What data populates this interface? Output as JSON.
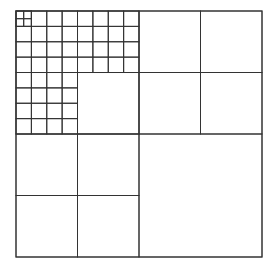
{
  "diagram": {
    "type": "quadtree-subdivision",
    "background": "#ffffff",
    "line_color": "#333333",
    "origin": [
      16,
      11
    ],
    "size": 246,
    "cells": [
      {
        "x": 0,
        "y": 0,
        "s": 1
      },
      {
        "x": 0,
        "y": 0,
        "s": 0.5
      },
      {
        "x": 0.5,
        "y": 0,
        "s": 0.25
      },
      {
        "x": 0.75,
        "y": 0,
        "s": 0.25
      },
      {
        "x": 0.5,
        "y": 0.25,
        "s": 0.25
      },
      {
        "x": 0.75,
        "y": 0.25,
        "s": 0.25
      },
      {
        "x": 0,
        "y": 0.5,
        "s": 0.25
      },
      {
        "x": 0.25,
        "y": 0.5,
        "s": 0.25
      },
      {
        "x": 0,
        "y": 0.75,
        "s": 0.25
      },
      {
        "x": 0.25,
        "y": 0.75,
        "s": 0.25
      },
      {
        "x": 0.5,
        "y": 0.5,
        "s": 0.5
      },
      {
        "x": 0.25,
        "y": 0.25,
        "s": 0.25
      }
    ],
    "fine_grid": {
      "region": "top-left quadrant excluding its bottom-right quarter",
      "cell_fraction": 0.0625,
      "corner_sub_cell_fraction": 0.03125
    }
  }
}
